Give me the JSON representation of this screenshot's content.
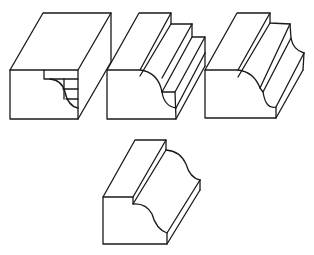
{
  "figure": {
    "description": "Four isometric line drawings of wood blocks showing molding profiles",
    "colors": {
      "stroke": "#1a1a1a",
      "background": "#ffffff"
    },
    "blocks": [
      {
        "id": 1,
        "label": "Rectangular block with cove profile layout marked on end"
      },
      {
        "id": 2,
        "label": "Block with stepped rebates and cove cut"
      },
      {
        "id": 3,
        "label": "Block with rebate and cove profile"
      },
      {
        "id": 4,
        "label": "Finished ogee molding"
      }
    ]
  }
}
